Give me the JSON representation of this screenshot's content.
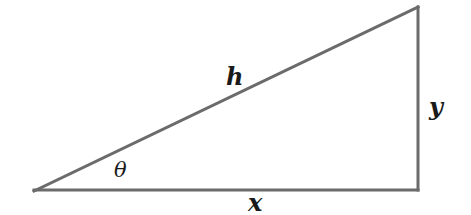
{
  "diagram": {
    "type": "right-triangle",
    "stroke_color": "#6b6b6b",
    "label_color": "#1a1a1a",
    "vertices": {
      "left_acute": [
        34,
        191
      ],
      "right_angle": [
        418,
        190
      ],
      "top": [
        418,
        7
      ]
    },
    "labels": {
      "hypotenuse": "h",
      "vertical_leg": "y",
      "horizontal_leg": "x",
      "angle": "θ"
    }
  }
}
